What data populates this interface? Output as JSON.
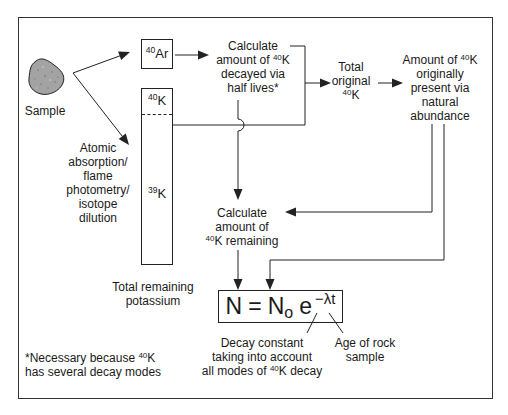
{
  "colors": {
    "ink": "#1a1a1a",
    "sample_fill": "#a3a3a3",
    "background": "#ffffff"
  },
  "diagram": {
    "sample": {
      "label": "Sample"
    },
    "ar_box": {
      "sup": "40",
      "element": "Ar"
    },
    "k_column": {
      "top_sup": "40",
      "top_element": "K",
      "bottom_sup": "39",
      "bottom_element": "K",
      "caption": [
        "Total remaining",
        "potassium"
      ]
    },
    "method": {
      "lines": [
        "Atomic",
        "absorption/",
        "flame",
        "photometry/",
        "isotope",
        "dilution"
      ]
    },
    "decayed": {
      "line1": "Calculate",
      "line2_pre": "amount of ",
      "line2_sup": "40",
      "line2_post": "K",
      "line3": "decayed via",
      "line4": "half lives*"
    },
    "total_original": {
      "line1": "Total",
      "line2": "original",
      "line3_sup": "40",
      "line3_post": "K"
    },
    "natural": {
      "line1_pre": "Amount of ",
      "line1_sup": "40",
      "line1_post": "K",
      "line2": "originally",
      "line3": "present via",
      "line4": "natural",
      "line5": "abundance"
    },
    "remaining": {
      "line1": "Calculate",
      "line2": "amount of",
      "line3_sup": "40",
      "line3_post": "K remaining"
    },
    "formula": {
      "lhs": "N",
      "eq": "=",
      "n0": "N",
      "n0_sub": "o",
      "base": "e",
      "exponent": "−λt"
    },
    "decay_constant": {
      "line1": "Decay constant",
      "line2": "taking into account",
      "line3_pre": "all modes of ",
      "line3_sup": "40",
      "line3_post": "K decay"
    },
    "age": {
      "line1": "Age of rock",
      "line2": "sample"
    },
    "footnote": {
      "line1_pre": "*Necessary because ",
      "line1_sup": "40",
      "line1_post": "K",
      "line2": "has several decay modes"
    }
  }
}
